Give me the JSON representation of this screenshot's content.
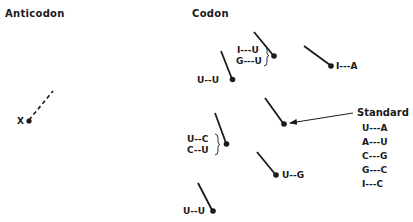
{
  "headers": {
    "anticodon": "Anticodon",
    "codon": "Codon"
  },
  "anticodon": {
    "label": "X",
    "line_style": "dashed"
  },
  "codon_pairs": [
    {
      "id": "uu-top",
      "labels": [
        "U--U"
      ]
    },
    {
      "id": "iu-gu",
      "labels": [
        "I---U",
        "G---U"
      ],
      "bracketed": true
    },
    {
      "id": "ia",
      "labels": [
        "I---A"
      ]
    },
    {
      "id": "standard",
      "labels": []
    },
    {
      "id": "uc-cu",
      "labels": [
        "U--C",
        "C--U"
      ],
      "bracketed": true
    },
    {
      "id": "ug",
      "labels": [
        "U--G"
      ]
    },
    {
      "id": "uu-bottom",
      "labels": [
        "U--U"
      ]
    }
  ],
  "standard": {
    "title": "Standard",
    "pairs": [
      "U---A",
      "A---U",
      "C---G",
      "G---C",
      "I---C"
    ]
  },
  "colors": {
    "ink": "#1a1a1a",
    "background": "#ffffff"
  }
}
